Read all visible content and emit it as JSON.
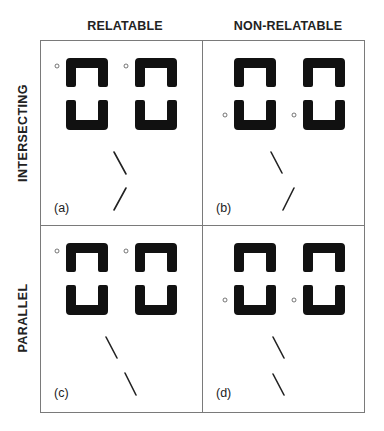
{
  "figure": {
    "columns": [
      {
        "label": "RELATABLE"
      },
      {
        "label": "NON-RELATABLE"
      }
    ],
    "rows": [
      {
        "label": "INTERSECTING"
      },
      {
        "label": "PARALLEL"
      }
    ],
    "panels": [
      {
        "id": "a",
        "label": "(a)",
        "row": "INTERSECTING",
        "column": "RELATABLE",
        "dot_position": "upper",
        "line_pair": "intersecting-aligned"
      },
      {
        "id": "b",
        "label": "(b)",
        "row": "INTERSECTING",
        "column": "NON-RELATABLE",
        "dot_position": "lower",
        "line_pair": "intersecting-offset"
      },
      {
        "id": "c",
        "label": "(c)",
        "row": "PARALLEL",
        "column": "RELATABLE",
        "dot_position": "upper",
        "line_pair": "parallel-collinear"
      },
      {
        "id": "d",
        "label": "(d)",
        "row": "PARALLEL",
        "column": "NON-RELATABLE",
        "dot_position": "lower",
        "line_pair": "parallel-offset"
      }
    ],
    "colors": {
      "ink": "#111111",
      "frame": "#7a7a7a",
      "text": "#222222",
      "background": "#ffffff"
    }
  }
}
